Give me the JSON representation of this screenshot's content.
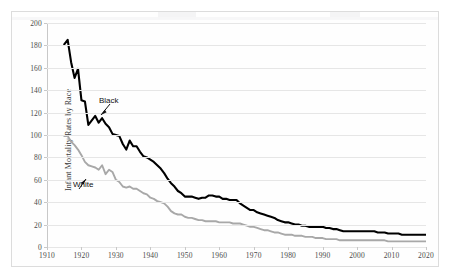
{
  "figure": {
    "y_axis_title": "Infant Mortality Rates by Race"
  },
  "annotations": {
    "black_label": "Black",
    "white_label": "White"
  },
  "colors": {
    "black_series": "#000000",
    "white_series": "#a8a8a8",
    "gridline": "#e6e6e6",
    "axis": "#c8c8c8",
    "border": "#dcdcdc",
    "background": "#ffffff",
    "tick_text": "#4a4a4a"
  },
  "chart_data": {
    "type": "line",
    "title": "",
    "subtitle": "",
    "xlabel": "",
    "ylabel": "Infant Mortality Rates by Race",
    "xlim": [
      1910,
      2020
    ],
    "ylim": [
      0,
      200
    ],
    "x_ticks": [
      1910,
      1920,
      1930,
      1940,
      1950,
      1960,
      1970,
      1980,
      1990,
      2000,
      2010,
      2020
    ],
    "y_ticks": [
      0,
      20,
      40,
      60,
      80,
      100,
      120,
      140,
      160,
      180,
      200
    ],
    "grid": "horizontal",
    "legend": "inline-annotations",
    "legend_position": "in-plot",
    "series": [
      {
        "name": "Black",
        "color": "#000000",
        "x": [
          1915,
          1916,
          1917,
          1918,
          1919,
          1920,
          1921,
          1922,
          1923,
          1924,
          1925,
          1926,
          1927,
          1928,
          1929,
          1930,
          1931,
          1932,
          1933,
          1934,
          1935,
          1936,
          1937,
          1938,
          1939,
          1940,
          1941,
          1942,
          1943,
          1944,
          1945,
          1946,
          1947,
          1948,
          1949,
          1950,
          1951,
          1952,
          1953,
          1954,
          1955,
          1956,
          1957,
          1958,
          1959,
          1960,
          1961,
          1962,
          1963,
          1964,
          1965,
          1966,
          1967,
          1968,
          1969,
          1970,
          1971,
          1972,
          1973,
          1974,
          1975,
          1976,
          1977,
          1978,
          1979,
          1980,
          1981,
          1982,
          1983,
          1984,
          1985,
          1986,
          1987,
          1988,
          1989,
          1990,
          1991,
          1992,
          1993,
          1994,
          1995,
          1996,
          1997,
          1998,
          1999,
          2000,
          2001,
          2002,
          2003,
          2004,
          2005,
          2006,
          2007,
          2008,
          2009,
          2010,
          2011,
          2012,
          2013,
          2014,
          2015,
          2016,
          2017,
          2018,
          2019,
          2020
        ],
        "y": [
          181,
          185,
          165,
          151,
          159,
          131,
          130,
          109,
          113,
          117,
          111,
          115,
          110,
          107,
          101,
          100,
          99,
          92,
          87,
          95,
          90,
          90,
          85,
          81,
          80,
          78,
          76,
          73,
          70,
          66,
          61,
          57,
          54,
          50,
          48,
          45,
          45,
          45,
          44,
          43,
          44,
          44,
          46,
          46,
          45,
          45,
          43,
          43,
          42,
          42,
          42,
          39,
          37,
          35,
          33,
          33,
          31,
          30,
          29,
          28,
          27,
          26,
          24,
          23,
          22,
          22,
          21,
          20,
          20,
          19,
          19,
          18,
          18,
          18,
          18,
          18,
          17,
          17,
          16,
          16,
          15,
          14,
          14,
          14,
          14,
          14,
          14,
          14,
          14,
          14,
          14,
          13,
          13,
          13,
          12,
          12,
          12,
          12,
          11,
          11,
          11,
          11,
          11,
          11,
          11,
          11
        ]
      },
      {
        "name": "White",
        "color": "#a8a8a8",
        "x": [
          1915,
          1916,
          1917,
          1918,
          1919,
          1920,
          1921,
          1922,
          1923,
          1924,
          1925,
          1926,
          1927,
          1928,
          1929,
          1930,
          1931,
          1932,
          1933,
          1934,
          1935,
          1936,
          1937,
          1938,
          1939,
          1940,
          1941,
          1942,
          1943,
          1944,
          1945,
          1946,
          1947,
          1948,
          1949,
          1950,
          1951,
          1952,
          1953,
          1954,
          1955,
          1956,
          1957,
          1958,
          1959,
          1960,
          1961,
          1962,
          1963,
          1964,
          1965,
          1966,
          1967,
          1968,
          1969,
          1970,
          1971,
          1972,
          1973,
          1974,
          1975,
          1976,
          1977,
          1978,
          1979,
          1980,
          1981,
          1982,
          1983,
          1984,
          1985,
          1986,
          1987,
          1988,
          1989,
          1990,
          1991,
          1992,
          1993,
          1994,
          1995,
          1996,
          1997,
          1998,
          1999,
          2000,
          2001,
          2002,
          2003,
          2004,
          2005,
          2006,
          2007,
          2008,
          2009,
          2010,
          2011,
          2012,
          2013,
          2014,
          2015,
          2016,
          2017,
          2018,
          2019,
          2020
        ],
        "y": [
          99,
          99,
          94,
          91,
          87,
          82,
          76,
          73,
          72,
          71,
          69,
          73,
          65,
          69,
          67,
          60,
          58,
          54,
          53,
          54,
          52,
          52,
          50,
          48,
          47,
          44,
          43,
          41,
          40,
          39,
          36,
          32,
          30,
          29,
          29,
          27,
          26,
          26,
          25,
          24,
          24,
          23,
          23,
          23,
          23,
          22,
          22,
          22,
          22,
          21,
          21,
          21,
          20,
          19,
          18,
          18,
          17,
          16,
          15,
          15,
          14,
          13,
          13,
          12,
          11,
          11,
          11,
          10,
          10,
          10,
          9,
          9,
          9,
          8,
          8,
          8,
          7,
          7,
          7,
          7,
          6,
          6,
          6,
          6,
          6,
          6,
          6,
          6,
          6,
          6,
          6,
          6,
          6,
          6,
          5,
          5,
          5,
          5,
          5,
          5,
          5,
          5,
          5,
          5,
          5,
          5
        ]
      }
    ]
  }
}
